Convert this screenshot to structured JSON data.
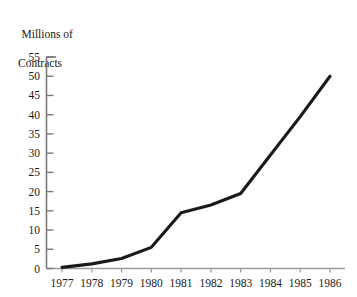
{
  "chart_data": {
    "type": "line",
    "title": "",
    "ylabel_lines": [
      "Millions of",
      "Contracts"
    ],
    "xlabel": "",
    "ylabel": "Millions of Contracts",
    "categories": [
      "1977",
      "1978",
      "1979",
      "1980",
      "1981",
      "1982",
      "1983",
      "1984",
      "1985",
      "1986"
    ],
    "x": [
      1977,
      1978,
      1979,
      1980,
      1981,
      1982,
      1983,
      1984,
      1985,
      1986
    ],
    "values": [
      0.3,
      1.2,
      2.6,
      5.5,
      14.5,
      16.5,
      19.5,
      29.5,
      39.5,
      50.0
    ],
    "series": [
      {
        "name": "Contracts",
        "values": [
          0.3,
          1.2,
          2.6,
          5.5,
          14.5,
          16.5,
          19.5,
          29.5,
          39.5,
          50.0
        ]
      }
    ],
    "ylim": [
      0,
      55
    ],
    "yticks": [
      0,
      5,
      10,
      15,
      20,
      25,
      30,
      35,
      40,
      45,
      50,
      55
    ],
    "ytick_labels": [
      "0",
      "5",
      "10",
      "15",
      "20",
      "25",
      "30",
      "35",
      "40",
      "45",
      "50",
      "55"
    ],
    "xtick_labels": [
      "1977",
      "1978",
      "1979",
      "1980",
      "1981",
      "1982",
      "1983",
      "1984",
      "1985",
      "1986"
    ],
    "grid": false,
    "legend": false,
    "legend_position": "none",
    "line_color": "#1a1a1a",
    "axis_color": "#7a7a7a",
    "background_color": "#ffffff"
  }
}
